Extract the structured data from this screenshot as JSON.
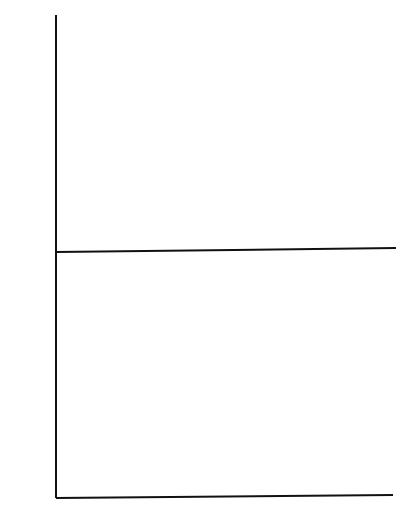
{
  "chart_data": [
    {
      "type": "scatter",
      "title": "",
      "xlabel": "",
      "ylabel": "km³",
      "ylim": [
        0,
        60
      ],
      "xlim": [
        1900,
        1985
      ],
      "yticks": [
        10,
        20,
        30,
        40,
        50,
        60
      ],
      "grid": false,
      "legend": null,
      "x": [
        1907,
        1908,
        1909,
        1910,
        1911,
        1912,
        1913,
        1914,
        1915,
        1916,
        1917,
        1918,
        1919,
        1920,
        1921,
        1922,
        1923,
        1924,
        1925,
        1926,
        1927,
        1928,
        1929,
        1930,
        1931,
        1932,
        1933,
        1934,
        1935,
        1936,
        1937,
        1938,
        1939,
        1940,
        1941,
        1942,
        1943,
        1944,
        1945,
        1946,
        1947,
        1948,
        1949,
        1950,
        1951,
        1952,
        1953,
        1954,
        1955,
        1956,
        1957,
        1958,
        1959,
        1960,
        1961,
        1962,
        1963,
        1964,
        1965,
        1966,
        1967,
        1968,
        1969,
        1970,
        1971,
        1972,
        1973,
        1974,
        1975,
        1976,
        1977
      ],
      "series": [
        {
          "name": "filled-squares",
          "marker": "filled-square",
          "values": [
            33.3,
            31.8,
            29.5,
            28.2,
            28.2,
            28.2,
            28.9,
            32.4,
            35.2,
            36.4,
            36.6,
            35.3,
            33.7,
            31.3,
            26.0,
            21.6,
            20.8,
            20.9,
            22.4,
            23.5,
            24.0,
            25.0,
            26.8,
            28.0,
            27.5,
            27.5,
            27.4,
            28.3,
            28.7,
            27.2,
            26.1,
            27.3,
            27.8,
            27.0,
            25.5,
            24.8,
            25.8,
            26.7,
            26.0,
            25.1,
            26.5,
            26.7,
            25.8,
            24.9,
            24.5,
            25.7,
            25.0,
            25.4,
            26.7,
            31.1,
            36.2,
            41.5,
            46.2,
            50.2,
            53.6,
            55.8,
            56.6,
            56.1,
            54.4,
            52.0,
            51.3,
            50.5,
            49.3,
            47.9,
            48.3,
            49.8,
            50.2
          ]
        },
        {
          "name": "open-squares",
          "marker": "open-square",
          "x": [
            1907,
            1908,
            1910,
            1911,
            1912,
            1913,
            1914,
            1915,
            1916,
            1917,
            1918,
            1919,
            1920,
            1921,
            1922,
            1923,
            1924,
            1925,
            1926,
            1927,
            1928,
            1930,
            1931,
            1933,
            1934,
            1935,
            1936,
            1937,
            1938,
            1939,
            1940,
            1941,
            1942,
            1943,
            1944,
            1945,
            1946,
            1947,
            1948,
            1949,
            1950,
            1952,
            1954,
            1956,
            1957,
            1958,
            1959,
            1960,
            1961,
            1962,
            1963,
            1964,
            1965,
            1966,
            1967,
            1968,
            1970,
            1972,
            1974,
            1975,
            1976,
            1977
          ],
          "values": [
            15.3,
            15.2,
            15.3,
            15.2,
            15.0,
            15.0,
            15.4,
            16.2,
            17.0,
            16.9,
            17.0,
            16.6,
            15.8,
            15.0,
            13.8,
            12.8,
            12.8,
            12.9,
            13.2,
            13.6,
            14.3,
            14.7,
            15.4,
            15.3,
            15.7,
            15.5,
            15.2,
            14.6,
            14.4,
            14.4,
            14.5,
            14.8,
            14.2,
            14.3,
            14.4,
            14.4,
            14.3,
            14.3,
            14.2,
            14.4,
            14.4,
            14.5,
            14.5,
            14.6,
            14.5,
            16.0,
            18.8,
            21.3,
            22.4,
            23.5,
            24.6,
            25.6,
            25.6,
            23.7,
            22.3,
            21.9,
            21.4,
            21.3,
            21.6,
            21.9,
            22.2,
            22.0
          ]
        }
      ]
    },
    {
      "type": "scatter",
      "title": "",
      "xlabel": "",
      "ylabel": "mm",
      "ylim": [
        600,
        1200
      ],
      "xlim": [
        1900,
        1985
      ],
      "yticks": [
        600,
        800,
        1000,
        1200
      ],
      "xticks": [
        1910,
        1930,
        1950,
        1970
      ],
      "grid": false,
      "legend": null,
      "series": [
        {
          "name": "open-circles",
          "marker": "open-circle",
          "x": [
            1907,
            1908,
            1909,
            1910,
            1911,
            1912,
            1913,
            1914,
            1915,
            1916,
            1917,
            1918,
            1919,
            1920,
            1921,
            1922,
            1923,
            1924,
            1925,
            1926,
            1927,
            1928,
            1929,
            1930,
            1931,
            1932,
            1933,
            1934,
            1935,
            1936,
            1937,
            1938,
            1939,
            1940,
            1941,
            1942,
            1943,
            1944,
            1945,
            1946,
            1947,
            1948,
            1949,
            1950,
            1951,
            1952,
            1953,
            1954,
            1955,
            1956,
            1957,
            1958,
            1959,
            1960,
            1961,
            1962,
            1963,
            1964,
            1965,
            1966,
            1967,
            1968,
            1969,
            1970,
            1971,
            1972,
            1973,
            1974,
            1975,
            1976,
            1977
          ],
          "values": [
            905,
            920,
            868,
            885,
            880,
            892,
            928,
            945,
            972,
            1043,
            1025,
            1010,
            1014,
            963,
            960,
            918,
            862,
            900,
            910,
            870,
            880,
            890,
            895,
            922,
            878,
            832,
            836,
            825,
            808,
            792,
            790,
            810,
            810,
            835,
            852,
            878,
            906,
            925,
            945,
            972,
            948,
            927,
            893,
            883,
            872,
            852,
            842,
            860,
            862,
            862,
            895,
            899,
            890,
            890,
            852,
            875,
            893,
            862,
            833,
            845,
            853,
            866,
            845,
            845,
            860,
            856,
            845,
            845,
            860,
            885,
            885
          ]
        }
      ]
    }
  ],
  "axes": {
    "top": {
      "unit": "km³",
      "ticks": [
        "60",
        "50",
        "40",
        "30",
        "20",
        "10"
      ]
    },
    "bottom": {
      "unit": "mm",
      "ticks": [
        "1200",
        "1000",
        "800",
        "600"
      ]
    },
    "x": {
      "ticks": [
        "1910",
        "1930",
        "1950",
        "1970"
      ]
    }
  }
}
